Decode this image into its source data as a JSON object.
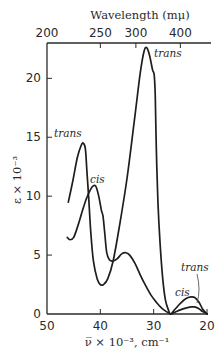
{
  "chart_data": {
    "type": "line",
    "title": "",
    "top_axis_title": "Wavelength (mμ)",
    "top_ticks": [
      {
        "label": "200",
        "wavelength": 200
      },
      {
        "label": "250",
        "wavelength": 250
      },
      {
        "label": "300",
        "wavelength": 300
      },
      {
        "label": "400",
        "wavelength": 400
      }
    ],
    "xlabel": "ν̅ × 10⁻³, cm⁻¹",
    "ylabel": "ε × 10⁻³",
    "xlim": [
      50,
      20
    ],
    "ylim": [
      0,
      23
    ],
    "x_ticks": [
      50,
      40,
      30,
      20
    ],
    "y_ticks": [
      0,
      5,
      10,
      15,
      20
    ],
    "grid": false,
    "series": [
      {
        "name": "trans",
        "x": [
          46.0,
          45.2,
          44.3,
          43.6,
          43.2,
          42.8,
          42.5,
          42.2,
          41.8,
          41.3,
          40.6,
          40.0,
          39.4,
          38.6,
          37.6,
          36.4,
          35.0,
          33.6,
          32.5,
          31.8,
          31.3,
          30.8,
          30.2,
          29.9,
          29.7,
          29.5,
          29.2,
          28.8,
          28.3,
          27.8,
          27.2,
          26.8,
          26.0,
          25.0,
          24.0,
          23.0,
          22.3,
          21.5,
          20.8,
          20.0
        ],
        "y": [
          9.5,
          11.2,
          13.3,
          14.3,
          14.5,
          14.0,
          12.0,
          10.0,
          7.0,
          4.5,
          3.0,
          2.5,
          2.5,
          3.0,
          4.5,
          7.5,
          11.5,
          16.5,
          20.5,
          22.3,
          22.6,
          22.0,
          20.7,
          20.3,
          18.5,
          14.0,
          9.5,
          6.0,
          3.0,
          1.2,
          0.3,
          0.0,
          0.4,
          0.9,
          1.3,
          1.45,
          1.4,
          1.0,
          0.4,
          0.0
        ]
      },
      {
        "name": "cis",
        "x": [
          46.2,
          45.7,
          45.0,
          44.2,
          43.4,
          42.6,
          41.8,
          41.2,
          40.8,
          40.3,
          39.8,
          39.5,
          39.2,
          38.8,
          38.3,
          37.6,
          36.8,
          36.0,
          35.2,
          34.5,
          33.5,
          32.5,
          31.5,
          30.5,
          29.5,
          28.5,
          27.6,
          26.8,
          26.0,
          25.0,
          24.0,
          23.0,
          22.3,
          21.5,
          20.8,
          20.0
        ],
        "y": [
          6.5,
          6.3,
          6.5,
          7.5,
          8.7,
          9.8,
          10.6,
          10.9,
          10.8,
          10.0,
          8.8,
          8.3,
          7.0,
          5.2,
          4.6,
          4.5,
          4.7,
          5.1,
          5.2,
          5.0,
          4.3,
          3.3,
          2.4,
          1.6,
          1.0,
          0.5,
          0.2,
          0.0,
          0.15,
          0.35,
          0.5,
          0.6,
          0.6,
          0.45,
          0.2,
          0.0
        ]
      }
    ],
    "annotations": [
      {
        "text": "trans",
        "near": "peak at 43.2"
      },
      {
        "text": "cis",
        "near": "peak at 41.0"
      },
      {
        "text": "trans",
        "near": "peak at 31.3"
      },
      {
        "text": "trans",
        "near": "band at 22.5"
      },
      {
        "text": "cis",
        "near": "band at 22.5"
      }
    ]
  }
}
